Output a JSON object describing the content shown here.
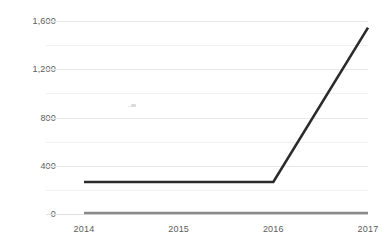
{
  "chart_data": {
    "type": "line",
    "title": "",
    "subtitle": "",
    "xlabel": "",
    "ylabel": "",
    "categories": [
      "2014",
      "2015",
      "2016",
      "2017"
    ],
    "x": [
      2014,
      2015,
      2016,
      2017
    ],
    "series": [
      {
        "name": "series-1",
        "color": "#2b2b2b",
        "values": [
          265,
          265,
          265,
          1545
        ]
      },
      {
        "name": "series-2",
        "color": "#8a8a8a",
        "values": [
          8,
          8,
          8,
          8
        ]
      }
    ],
    "ylim": [
      0,
      1600
    ],
    "xlim": [
      "2014",
      "2017"
    ],
    "y_major_ticks": [
      "0",
      "400",
      "800",
      "1,200",
      "1,600"
    ],
    "y_major_values": [
      0,
      400,
      800,
      1200,
      1600
    ],
    "y_minor_values": [
      200,
      600,
      1000,
      1400
    ],
    "x_tick_labels": [
      "2014",
      "2015",
      "2016",
      "2017"
    ],
    "grid": "horizontal",
    "legend": "none",
    "annotations": [],
    "colors": {
      "gridline_major": "#e8e8e8",
      "gridline_minor": "#f0f0f0",
      "tick_label": "#5c5c5c",
      "background": "#ffffff"
    }
  }
}
